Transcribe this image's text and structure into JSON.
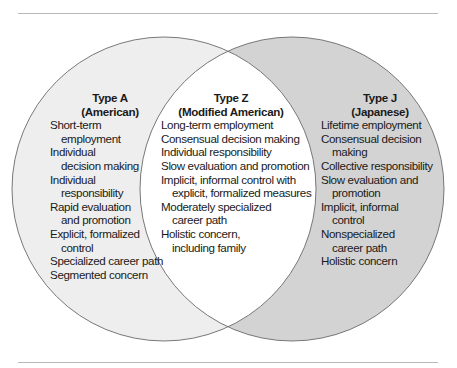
{
  "diagram": {
    "type": "venn",
    "colors": {
      "left_fill": "#eeeeee",
      "right_fill": "#d3d3d3",
      "overlap_fill": "#ffffff",
      "outline": "#6a6a6a",
      "rule": "#b8b8b8"
    },
    "sets": [
      {
        "id": "type-a",
        "title": "Type A",
        "subtitle": "(American)",
        "items": [
          {
            "first": "Short-term",
            "cont": "employment"
          },
          {
            "first": "Individual",
            "cont": "decision making"
          },
          {
            "first": "Individual",
            "cont": "responsibility"
          },
          {
            "first": "Rapid evaluation",
            "cont": "and promotion"
          },
          {
            "first": "Explicit, formalized",
            "cont": "control"
          },
          {
            "first": "Specialized career path",
            "cont": ""
          },
          {
            "first": "Segmented concern",
            "cont": ""
          }
        ]
      },
      {
        "id": "type-z",
        "title": "Type Z",
        "subtitle": "(Modified American)",
        "items": [
          {
            "first": "Long-term employment",
            "cont": ""
          },
          {
            "first": "Consensual decision making",
            "cont": ""
          },
          {
            "first": "Individual responsibility",
            "cont": ""
          },
          {
            "first": "Slow evaluation and promotion",
            "cont": ""
          },
          {
            "first": "Implicit, informal control with",
            "cont": "explicit, formalized measures"
          },
          {
            "first": "Moderately specialized",
            "cont": "career path"
          },
          {
            "first": "Holistic concern,",
            "cont": "including family"
          }
        ]
      },
      {
        "id": "type-j",
        "title": "Type J",
        "subtitle": "(Japanese)",
        "items": [
          {
            "first": "Lifetime employment",
            "cont": ""
          },
          {
            "first": "Consensual decision",
            "cont": "making"
          },
          {
            "first": "Collective responsibility",
            "cont": ""
          },
          {
            "first": "Slow evaluation and",
            "cont": "promotion"
          },
          {
            "first": "Implicit, informal",
            "cont": "control"
          },
          {
            "first": "Nonspecialized",
            "cont": "career path"
          },
          {
            "first": "Holistic concern",
            "cont": ""
          }
        ]
      }
    ]
  }
}
